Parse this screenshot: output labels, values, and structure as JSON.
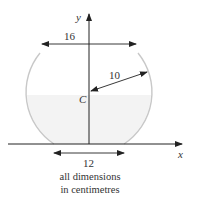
{
  "diagram": {
    "axes": {
      "x_label": "x",
      "y_label": "y"
    },
    "center_label": "C",
    "dimensions": {
      "top_opening": "16",
      "radius": "10",
      "base": "12"
    },
    "caption": {
      "line1": "all dimensions",
      "line2": "in centimetres"
    },
    "colors": {
      "outline": "#c8c8c8",
      "fill": "#f3f3f3",
      "axis": "#333333"
    }
  }
}
